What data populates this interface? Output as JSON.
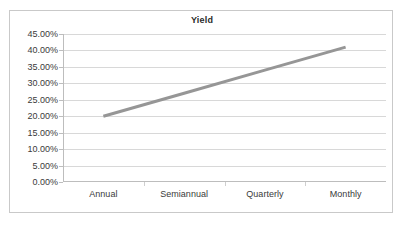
{
  "chart_data": {
    "type": "line",
    "title": "Yield",
    "xlabel": "",
    "ylabel": "",
    "grid": true,
    "legend": false,
    "legend_position": "none",
    "categories": [
      "Annual",
      "Semiannual",
      "Quarterly",
      "Monthly"
    ],
    "ytick_labels": [
      "0.00%",
      "5.00%",
      "10.00%",
      "15.00%",
      "20.00%",
      "25.00%",
      "30.00%",
      "35.00%",
      "40.00%",
      "45.00%"
    ],
    "ytick_values": [
      0,
      5,
      10,
      15,
      20,
      25,
      30,
      35,
      40,
      45
    ],
    "ylim": [
      0,
      45
    ],
    "series": [
      {
        "name": "Yield",
        "color": "#969696",
        "line_width": 3,
        "markers": false,
        "values": [
          20.0,
          27.0,
          34.0,
          41.0
        ]
      }
    ],
    "annotations": []
  },
  "chart": {
    "title": "Yield",
    "accent_color": "#969696",
    "gridline_color": "#d8d8d8",
    "axis_color": "#bdbdbd",
    "border_color": "#c9c9c9",
    "text_color": "#3a3a3a",
    "background": "#ffffff"
  }
}
